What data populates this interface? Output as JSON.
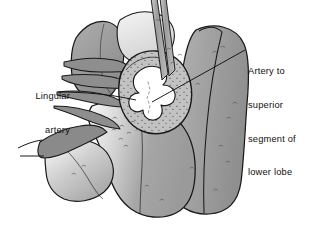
{
  "figure": {
    "background_color": "#ffffff",
    "width": 315,
    "height": 229
  },
  "labels": {
    "lingular": {
      "line1": "Lingular",
      "line2": "artery",
      "full_text": "Lingular artery",
      "align": "right",
      "leader": "horizontal line from label to cut artery branches"
    },
    "superior_segment": {
      "line1": "Artery to",
      "line2": "superior",
      "line3": "segment of",
      "line4": "lower lobe",
      "full_text": "Artery to superior segment of lower lobe",
      "align": "left",
      "leader": "diagonal line from label down-left to vessel stump"
    }
  },
  "colors": {
    "outline": "#1a1a1a",
    "lobe_light": "#d6d6d6",
    "lobe_mid": "#9a9a9a",
    "lobe_dark": "#8c8c8c",
    "vessel_dark": "#8a8a8a",
    "stipple_wall": "#b4b4b4",
    "lumen": "#ffffff",
    "instrument": "#a8a8a8",
    "instrument_dark": "#8d8d8d",
    "label_text": "#111111",
    "leader_line": "#111111"
  },
  "anatomy": {
    "structures": [
      "upper lobe",
      "lower lobe",
      "lingular artery branches",
      "artery to superior segment of lower lobe",
      "cut pulmonary artery cross-section",
      "surgical forceps"
    ]
  }
}
